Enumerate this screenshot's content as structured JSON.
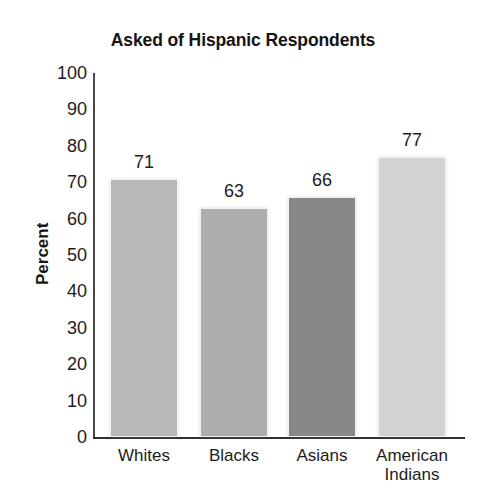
{
  "chart_data": {
    "type": "bar",
    "title": "Asked of Hispanic Respondents",
    "xlabel": "",
    "ylabel": "Percent",
    "categories": [
      "Whites",
      "Blacks",
      "Asians",
      "American Indians"
    ],
    "values": [
      71,
      63,
      66,
      77
    ],
    "value_labels": [
      "71",
      "63",
      "66",
      "77"
    ],
    "ylim": [
      0,
      100
    ],
    "ytick_labels": [
      "100",
      "90",
      "80",
      "70",
      "60",
      "50",
      "40",
      "30",
      "20",
      "10",
      "0"
    ],
    "ytick_values": [
      100,
      90,
      80,
      70,
      60,
      50,
      40,
      30,
      20,
      10,
      0
    ],
    "ytick_step": 10,
    "grid": false,
    "legend": false,
    "legend_position": "none",
    "bar_colors": [
      "#b8b8b8",
      "#adadad",
      "#888888",
      "#d2d2d2"
    ],
    "bar_edge_color": "#f2f2f2",
    "axis_color": "#303030",
    "text_color": "#1c1c1c",
    "background": "#ffffff",
    "category_label_lines": [
      [
        "Whites"
      ],
      [
        "Blacks"
      ],
      [
        "Asians"
      ],
      [
        "American",
        "Indians"
      ]
    ]
  }
}
